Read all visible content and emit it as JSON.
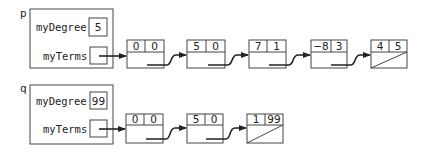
{
  "diagram": {
    "type": "linked-list-memory-diagram",
    "objects": [
      {
        "var": "p",
        "fields": {
          "degree_label": "myDegree",
          "degree_value": "5",
          "terms_label": "myTerms"
        },
        "nodes": [
          {
            "coef": "0",
            "exp": "0",
            "next": "pointer"
          },
          {
            "coef": "5",
            "exp": "0",
            "next": "pointer"
          },
          {
            "coef": "7",
            "exp": "1",
            "next": "pointer"
          },
          {
            "coef": "−8",
            "exp": "3",
            "next": "pointer"
          },
          {
            "coef": "4",
            "exp": "5",
            "next": "null"
          }
        ]
      },
      {
        "var": "q",
        "fields": {
          "degree_label": "myDegree",
          "degree_value": "99",
          "terms_label": "myTerms"
        },
        "nodes": [
          {
            "coef": "0",
            "exp": "0",
            "next": "pointer"
          },
          {
            "coef": "5",
            "exp": "0",
            "next": "pointer"
          },
          {
            "coef": "1",
            "exp": "99",
            "next": "null"
          }
        ]
      }
    ]
  },
  "p": {
    "label": "p",
    "degree_label": "myDegree",
    "degree_value": "5",
    "terms_label": "myTerms",
    "nodes": [
      {
        "coef": "0",
        "exp": "0"
      },
      {
        "coef": "5",
        "exp": "0"
      },
      {
        "coef": "7",
        "exp": "1"
      },
      {
        "coef": "−8",
        "exp": "3"
      },
      {
        "coef": "4",
        "exp": "5"
      }
    ]
  },
  "q": {
    "label": "q",
    "degree_label": "myDegree",
    "degree_value": "99",
    "terms_label": "myTerms",
    "nodes": [
      {
        "coef": "0",
        "exp": "0"
      },
      {
        "coef": "5",
        "exp": "0"
      },
      {
        "coef": "1",
        "exp": "99"
      }
    ]
  }
}
